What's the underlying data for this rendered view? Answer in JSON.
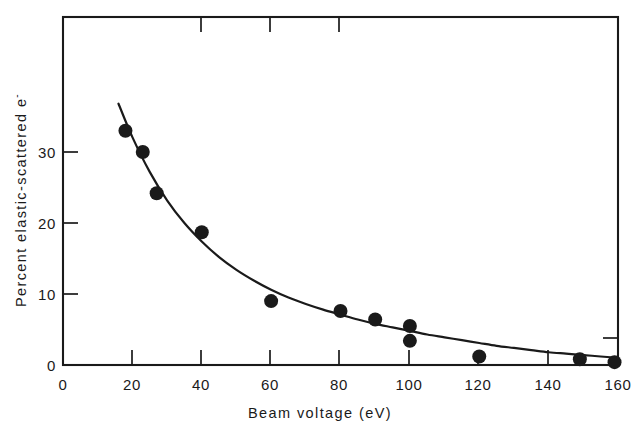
{
  "chart_data": {
    "type": "scatter",
    "title": "",
    "subtitle": "",
    "xlabel": "Beam voltage   (eV)",
    "ylabel": "Percent elastic-scattered e",
    "ylabel_superscript": "-",
    "xlim": [
      0,
      160
    ],
    "ylim": [
      0,
      40
    ],
    "x_ticks": [
      0,
      20,
      40,
      60,
      80,
      100,
      120,
      140,
      160
    ],
    "x_tick_labels": [
      "0",
      "20",
      "40",
      "60",
      "80",
      "100",
      "120",
      "140",
      "160"
    ],
    "y_ticks": [
      0,
      10,
      20,
      30
    ],
    "y_tick_labels": [
      "0",
      "10",
      "20",
      "30"
    ],
    "grid": false,
    "legend": null,
    "frame": "box",
    "marker": "filled-circle",
    "marker_color": "#1a1a1a",
    "line_color": "#1a1a1a",
    "points": [
      {
        "x": 18,
        "y": 33.0
      },
      {
        "x": 23,
        "y": 30.0
      },
      {
        "x": 27,
        "y": 24.2
      },
      {
        "x": 40,
        "y": 18.7
      },
      {
        "x": 60,
        "y": 9.0
      },
      {
        "x": 80,
        "y": 7.6
      },
      {
        "x": 90,
        "y": 6.4
      },
      {
        "x": 100,
        "y": 5.5
      },
      {
        "x": 100,
        "y": 3.4
      },
      {
        "x": 120,
        "y": 1.2
      },
      {
        "x": 149,
        "y": 0.8
      },
      {
        "x": 159,
        "y": 0.4
      }
    ],
    "fit_curve": {
      "name": "fitted decay curve",
      "x": [
        16,
        20,
        25,
        30,
        35,
        40,
        45,
        50,
        55,
        60,
        65,
        70,
        75,
        80,
        85,
        90,
        95,
        100,
        105,
        110,
        115,
        120,
        125,
        130,
        135,
        140,
        145,
        150,
        155,
        160
      ],
      "y": [
        36.8,
        32.1,
        27.2,
        23.2,
        20.0,
        17.4,
        15.2,
        13.4,
        11.9,
        10.6,
        9.5,
        8.6,
        7.8,
        7.1,
        6.4,
        5.8,
        5.3,
        4.8,
        4.3,
        3.9,
        3.5,
        3.1,
        2.7,
        2.4,
        2.1,
        1.8,
        1.6,
        1.4,
        1.2,
        1.0
      ]
    }
  },
  "axes": {
    "x_title": "Beam voltage   (eV)",
    "y_title_main": "Percent elastic-scattered e",
    "y_title_sup": "-"
  },
  "tick_labels": {
    "x": [
      "0",
      "20",
      "40",
      "60",
      "80",
      "100",
      "120",
      "140",
      "160"
    ],
    "y": [
      "0",
      "10",
      "20",
      "30"
    ]
  }
}
